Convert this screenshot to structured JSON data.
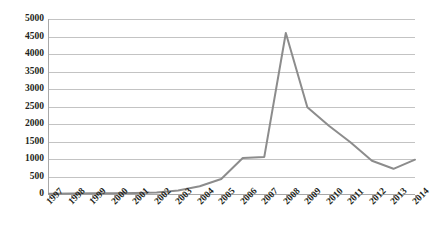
{
  "chart_data": {
    "type": "line",
    "title": "",
    "subtitle": "",
    "xlabel": "",
    "ylabel": "",
    "categories": [
      "1997",
      "1998",
      "1999",
      "2000",
      "2001",
      "2002",
      "2003",
      "2004",
      "2005",
      "2006",
      "2007",
      "2008",
      "2009",
      "2010",
      "2011",
      "2012",
      "2013",
      "2014"
    ],
    "x": [
      1997,
      1998,
      1999,
      2000,
      2001,
      2002,
      2003,
      2004,
      2005,
      2006,
      2007,
      2008,
      2009,
      2010,
      2011,
      2012,
      2013,
      2014
    ],
    "values": [
      10,
      15,
      20,
      25,
      30,
      45,
      100,
      220,
      430,
      1030,
      1060,
      4600,
      2480,
      1950,
      1480,
      950,
      720,
      980
    ],
    "series": [
      {
        "name": "series-1",
        "color": "#8c8c8c",
        "values": [
          10,
          15,
          20,
          25,
          30,
          45,
          100,
          220,
          430,
          1030,
          1060,
          4600,
          2480,
          1950,
          1480,
          950,
          720,
          980
        ]
      }
    ],
    "ylim": [
      0,
      5000
    ],
    "yticks": [
      0,
      500,
      1000,
      1500,
      2000,
      2500,
      3000,
      3500,
      4000,
      4500,
      5000
    ],
    "ytick_labels": [
      "0",
      "500",
      "1000",
      "1500",
      "2000",
      "2500",
      "3000",
      "3500",
      "4000",
      "4500",
      "5000"
    ],
    "grid": true,
    "grid_axis": "y",
    "legend": false,
    "legend_position": "none",
    "annotations": [],
    "colors": {
      "line": "#8c8c8c",
      "grid": "#c3c3c3",
      "axis": "#a8a8a8",
      "text": "#231f20",
      "background": "#ffffff"
    }
  }
}
